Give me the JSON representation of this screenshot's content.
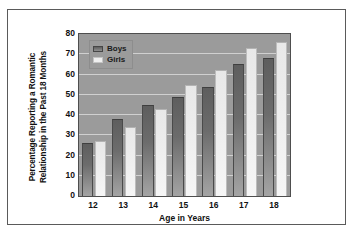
{
  "chart_data": {
    "type": "bar",
    "title": "",
    "categories": [
      "12",
      "13",
      "14",
      "15",
      "16",
      "17",
      "18"
    ],
    "series": [
      {
        "name": "Boys",
        "values": [
          26,
          38,
          45,
          49,
          54,
          65,
          68
        ],
        "color": "#6c6c6c"
      },
      {
        "name": "Girls",
        "values": [
          27,
          34,
          43,
          55,
          62,
          73,
          76
        ],
        "color": "#ededed"
      }
    ],
    "xlabel": "Age in Years",
    "ylabel_lines": [
      "Percentage Reporting a Romantic",
      "Relationship in the Past 18 Months"
    ],
    "ylim": [
      0,
      80
    ],
    "ytick_values": [
      0,
      10,
      20,
      30,
      40,
      50,
      60,
      70,
      80
    ],
    "ytick_labels": [
      "0",
      "10",
      "20",
      "30",
      "40",
      "50",
      "60",
      "70",
      "80"
    ],
    "grid": true,
    "grid_color": "#d9d9d9",
    "legend_position": "top-left",
    "plot_background": "#9b9b9b",
    "figure_background": "#ffffff",
    "axis_color": "#4e4e4e",
    "text_color": "#111111"
  },
  "legend": {
    "entries": [
      {
        "label": "Boys"
      },
      {
        "label": "Girls"
      }
    ]
  }
}
